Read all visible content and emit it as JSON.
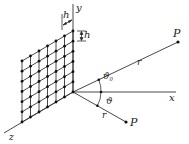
{
  "diagram": {
    "colors": {
      "line": "#333333",
      "dot": "#111111",
      "text": "#222222",
      "background": "#ffffff"
    },
    "grid": {
      "rows": 7,
      "cols": 7,
      "spacing_label": "h"
    },
    "labels": {
      "y_axis": "y",
      "x_axis": "x",
      "z_axis": "z",
      "spacing_h_top": "h",
      "spacing_h_right": "h",
      "point_upper": "P",
      "point_lower": "P",
      "distance_upper": "r",
      "distance_lower": "r",
      "angle_upper": "ϑ",
      "angle_upper_sub": "0",
      "angle_lower": "ϑ"
    }
  }
}
